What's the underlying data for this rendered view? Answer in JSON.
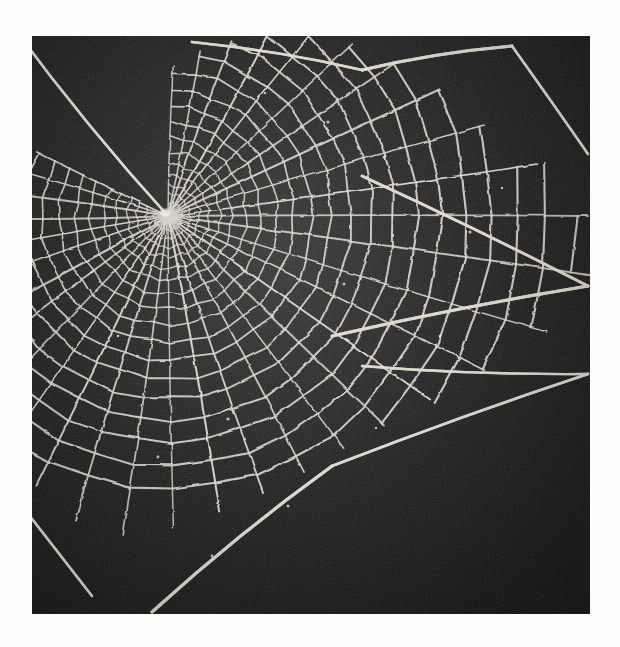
{
  "page": {
    "background_color": "#fdfdfc",
    "caption": ""
  },
  "photo": {
    "title": "Orb spider web",
    "subject": "spider-web",
    "medium": "black and white halftone photograph",
    "background_color": "#1e1e1e",
    "thread_color": "#e8e6e0",
    "bounds": {
      "x": 32,
      "y": 36,
      "width": 558,
      "height": 578
    },
    "hub": {
      "x": 136,
      "y": 180
    },
    "notes": "orb web with central hub offset to upper left; radial spokes fan clockwise; capture spiral forms concentric arcs; long straight frame and anchor threads run to the photo edges"
  },
  "chart_data": {
    "type": "scatter",
    "xlabel": "",
    "ylabel": "",
    "hub": [
      136,
      180
    ],
    "radial_count": 34,
    "spiral_turn_count": 22,
    "angle_start_deg": -88,
    "angle_end_deg": 214,
    "radials": [
      {
        "angle_deg": -88,
        "length": 150
      },
      {
        "angle_deg": -79,
        "length": 168
      },
      {
        "angle_deg": -70,
        "length": 186
      },
      {
        "angle_deg": -61,
        "length": 205
      },
      {
        "angle_deg": -52,
        "length": 228
      },
      {
        "angle_deg": -43,
        "length": 252
      },
      {
        "angle_deg": -34,
        "length": 276
      },
      {
        "angle_deg": -25,
        "length": 300
      },
      {
        "angle_deg": -16,
        "length": 330
      },
      {
        "angle_deg": -8,
        "length": 372
      },
      {
        "angle_deg": 0,
        "length": 420
      },
      {
        "angle_deg": 8,
        "length": 430
      },
      {
        "angle_deg": 17,
        "length": 396
      },
      {
        "angle_deg": 26,
        "length": 352
      },
      {
        "angle_deg": 35,
        "length": 320
      },
      {
        "angle_deg": 44,
        "length": 300
      },
      {
        "angle_deg": 53,
        "length": 292
      },
      {
        "angle_deg": 62,
        "length": 290
      },
      {
        "angle_deg": 71,
        "length": 292
      },
      {
        "angle_deg": 80,
        "length": 300
      },
      {
        "angle_deg": 89,
        "length": 312
      },
      {
        "angle_deg": 98,
        "length": 322
      },
      {
        "angle_deg": 107,
        "length": 318
      },
      {
        "angle_deg": 116,
        "length": 300
      },
      {
        "angle_deg": 125,
        "length": 276
      },
      {
        "angle_deg": 134,
        "length": 252
      },
      {
        "angle_deg": 143,
        "length": 230
      },
      {
        "angle_deg": 152,
        "length": 206
      },
      {
        "angle_deg": 161,
        "length": 186
      },
      {
        "angle_deg": 170,
        "length": 170
      },
      {
        "angle_deg": 179,
        "length": 160
      },
      {
        "angle_deg": 188,
        "length": 152
      },
      {
        "angle_deg": 197,
        "length": 148
      },
      {
        "angle_deg": 206,
        "length": 146
      }
    ],
    "spiral_radii": [
      14,
      22,
      31,
      41,
      52,
      64,
      78,
      93,
      109,
      126,
      144,
      163,
      183,
      204,
      226,
      249,
      273,
      298,
      324,
      351,
      379,
      408
    ],
    "frame_threads": [
      {
        "name": "upper-left-anchor",
        "from": [
          136,
          180
        ],
        "to": [
          -18,
          -8
        ]
      },
      {
        "name": "top-frame-left",
        "from": [
          160,
          6
        ],
        "to": [
          330,
          34
        ]
      },
      {
        "name": "top-frame-right",
        "from": [
          330,
          34
        ],
        "to": [
          480,
          10
        ]
      },
      {
        "name": "right-upper-anchor",
        "from": [
          480,
          10
        ],
        "to": [
          556,
          118
        ]
      },
      {
        "name": "right-frame-upper",
        "from": [
          330,
          140
        ],
        "to": [
          556,
          250
        ]
      },
      {
        "name": "right-frame-mid",
        "from": [
          556,
          250
        ],
        "to": [
          300,
          300
        ]
      },
      {
        "name": "right-frame-lower",
        "from": [
          330,
          330
        ],
        "to": [
          556,
          338
        ]
      },
      {
        "name": "right-lower-anchor",
        "from": [
          556,
          338
        ],
        "to": [
          300,
          430
        ]
      },
      {
        "name": "bottom-anchor",
        "from": [
          300,
          430
        ],
        "to": [
          120,
          576
        ]
      },
      {
        "name": "left-lower-anchor",
        "from": [
          60,
          560
        ],
        "to": [
          -10,
          470
        ]
      }
    ],
    "legend": [],
    "grid": false
  }
}
